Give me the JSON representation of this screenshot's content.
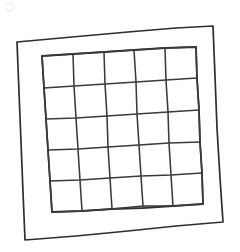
{
  "artwork": {
    "title": "Hand-drawn 5x5 grid in a frame",
    "medium": "pencil sketch on white paper",
    "background_color": "#ffffff",
    "ink_color": "#2e2e31",
    "grid_ink_color": "#3a3a3e",
    "smudge_color": "#ededf0",
    "canvas": {
      "width": 240,
      "height": 252
    }
  },
  "outer_frame": {
    "name": "outer-frame",
    "shape": "quadrilateral",
    "stroke_width": 1.7,
    "corners": {
      "top_left": [
        17,
        42
      ],
      "top_right": [
        213,
        26
      ],
      "bottom_right": [
        223,
        222
      ],
      "bottom_left": [
        25,
        240
      ]
    },
    "path": "M 17,42 L 72,37 L 128,32 L 176,28 L 213,26 L 215,76 L 217,128 L 220,178 L 223,222 L 176,226 L 128,231 L 76,236 L 25,240 L 23,192 L 21,142 L 19,92 Z"
  },
  "inner_grid": {
    "name": "inner-grid",
    "rows": 5,
    "columns": 5,
    "cell_count": 25,
    "stroke_width": 1.55,
    "corners": {
      "top_left": [
        42,
        56
      ],
      "top_right": [
        196,
        47
      ],
      "bottom_right": [
        203,
        204
      ],
      "bottom_left": [
        52,
        212
      ]
    },
    "border_path": "M 42,56 L 73,54 L 104,52 L 134,50 L 165,48 L 196,47 L 197,78 L 199,110 L 200,142 L 202,173 L 203,204 L 173,206 L 143,208 L 112,209 L 82,211 L 52,212 L 50,181 L 48,150 L 46,119 L 44,88 Z",
    "vertical_lines": [
      {
        "index": 0,
        "label": "left-border",
        "path": "M 42,56 L 44,88 L 46,119 L 48,150 L 50,181 L 52,212"
      },
      {
        "index": 1,
        "path": "M 73,54 L 74,86 L 76,118 L 78,149 L 80,180 L 82,211"
      },
      {
        "index": 2,
        "path": "M 104,52 L 105,84 L 107,116 L 108,147 L 110,178 L 112,209"
      },
      {
        "index": 3,
        "path": "M 134,50 L 136,82 L 137,114 L 139,145 L 141,176 L 143,206"
      },
      {
        "index": 4,
        "path": "M 165,48 L 166,80 L 168,112 L 169,143 L 171,175 L 173,206"
      },
      {
        "index": 5,
        "label": "right-border",
        "path": "M 196,47 L 197,78 L 199,110 L 200,142 L 202,173 L 203,204"
      }
    ],
    "horizontal_lines": [
      {
        "index": 0,
        "label": "top-border",
        "path": "M 42,56 L 73,54 L 104,52 L 134,50 L 165,48 L 196,47"
      },
      {
        "index": 1,
        "path": "M 44,88 L 74,86 L 105,84 L 136,82 L 166,80 L 197,78"
      },
      {
        "index": 2,
        "path": "M 46,119 L 76,118 L 107,116 L 137,114 L 168,112 L 199,110"
      },
      {
        "index": 3,
        "path": "M 48,150 L 78,149 L 108,147 L 139,145 L 169,143 L 200,142"
      },
      {
        "index": 4,
        "path": "M 50,181 L 80,180 L 110,178 L 141,176 L 171,175 L 202,173"
      },
      {
        "index": 5,
        "label": "bottom-border",
        "path": "M 52,212 L 82,211 L 112,209 L 143,206 L 173,206 L 203,204"
      }
    ]
  },
  "smudge": {
    "name": "paper-smudge",
    "description": "faint light pencil smudge near top-left of paper",
    "path": "M 6,4 q 4,-2 7,1 q 2,4 -2,6 q -4,1 -5,-3"
  }
}
